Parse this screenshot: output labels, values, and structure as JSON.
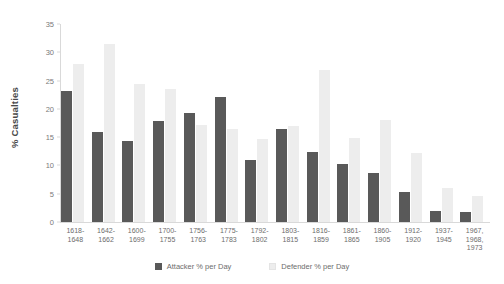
{
  "chart_data": {
    "type": "bar",
    "title": "",
    "xlabel": "",
    "ylabel": "% Casualties",
    "ylim": [
      0,
      35
    ],
    "ytick_step": 5,
    "yticks": [
      0,
      5,
      10,
      15,
      20,
      25,
      30,
      35
    ],
    "grid": false,
    "legend_position": "bottom",
    "categories": [
      "1618-\n1648",
      "1642-\n1662",
      "1600-\n1699",
      "1700-\n1755",
      "1756-\n1763",
      "1775-\n1783",
      "1792-\n1802",
      "1803-\n1815",
      "1816-\n1859",
      "1861-\n1865",
      "1860-\n1905",
      "1912-\n1920",
      "1937-\n1945",
      "1967,\n1968,\n1973"
    ],
    "series": [
      {
        "name": "Attacker % per Day",
        "color": "#595959",
        "values": [
          23.2,
          15.9,
          14.3,
          17.8,
          19.3,
          22.1,
          10.9,
          16.4,
          12.3,
          10.3,
          8.6,
          5.3,
          2.0,
          1.8
        ]
      },
      {
        "name": "Defender % per Day",
        "color": "#ededed",
        "values": [
          27.9,
          31.4,
          24.4,
          23.5,
          17.1,
          16.5,
          14.6,
          16.9,
          26.8,
          14.8,
          18.1,
          12.2,
          6.0,
          4.6
        ]
      }
    ]
  },
  "legend": {
    "items": [
      {
        "label": "Attacker % per Day",
        "swatch": "attacker-swatch"
      },
      {
        "label": "Defender % per Day",
        "swatch": "defender-swatch"
      }
    ]
  },
  "axes": {
    "y_title": "% Casualties"
  }
}
